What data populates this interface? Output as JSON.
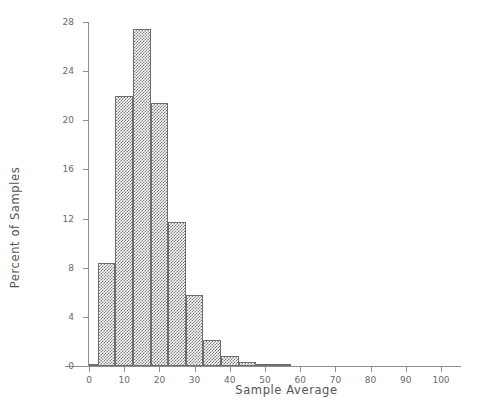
{
  "chart_data": {
    "type": "bar",
    "title": "",
    "subtitle": "",
    "xlabel": "Sample Average",
    "ylabel": "Percent of Samples",
    "xlim": [
      -7,
      105
    ],
    "ylim": [
      0,
      28
    ],
    "xticks": [
      0,
      10,
      20,
      30,
      40,
      50,
      60,
      70,
      80,
      90,
      100
    ],
    "yticks": [
      0,
      4,
      8,
      12,
      16,
      20,
      24,
      28
    ],
    "grid": false,
    "legend": null,
    "bin_width": 5,
    "bin_edges": [
      0,
      2.5,
      7.5,
      12.5,
      17.5,
      22.5,
      27.5,
      32.5,
      37.5,
      42.5,
      47.5,
      52.5,
      57.5
    ],
    "bars": [
      {
        "left": 0.0,
        "right": 2.5,
        "value": 0.2
      },
      {
        "left": 2.5,
        "right": 7.5,
        "value": 8.4
      },
      {
        "left": 7.5,
        "right": 12.5,
        "value": 22.0
      },
      {
        "left": 12.5,
        "right": 17.5,
        "value": 27.4
      },
      {
        "left": 17.5,
        "right": 22.5,
        "value": 21.4
      },
      {
        "left": 22.5,
        "right": 27.5,
        "value": 11.7
      },
      {
        "left": 27.5,
        "right": 32.5,
        "value": 5.8
      },
      {
        "left": 32.5,
        "right": 37.5,
        "value": 2.1
      },
      {
        "left": 37.5,
        "right": 42.5,
        "value": 0.8
      },
      {
        "left": 42.5,
        "right": 47.5,
        "value": 0.3
      },
      {
        "left": 47.5,
        "right": 52.5,
        "value": 0.15
      },
      {
        "left": 52.5,
        "right": 57.5,
        "value": 0.1
      }
    ],
    "categories": [
      "0-2.5",
      "2.5-7.5",
      "7.5-12.5",
      "12.5-17.5",
      "17.5-22.5",
      "22.5-27.5",
      "27.5-32.5",
      "32.5-37.5",
      "37.5-42.5",
      "42.5-47.5",
      "47.5-52.5",
      "52.5-57.5"
    ],
    "values": [
      0.2,
      8.4,
      22.0,
      27.4,
      21.4,
      11.7,
      5.8,
      2.1,
      0.8,
      0.3,
      0.15,
      0.1
    ],
    "colors": {
      "bar_fill": "#7b7b7b",
      "bar_edge": "#6e6e6e",
      "axis": "#8e8e8e",
      "text": "#555555",
      "background": "#ffffff"
    }
  }
}
